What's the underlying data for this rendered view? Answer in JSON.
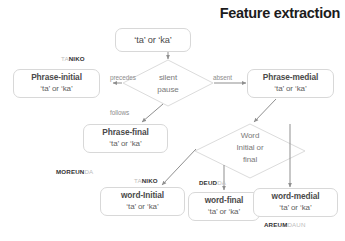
{
  "title": "Feature extraction",
  "nodes": {
    "root": {
      "line1": "‘ta’ or ‘ka’"
    },
    "phrase_initial": {
      "line1": "Phrase-initial",
      "line2": "‘ta’ or ‘ka’"
    },
    "phrase_medial": {
      "line1": "Phrase-medial",
      "line2": "‘ta’ or ‘ka’"
    },
    "phrase_final": {
      "line1": "Phrase-final",
      "line2": "‘ta’ or ‘ka’"
    },
    "word_initial": {
      "line1": "word-Initial",
      "line2": "‘ta’ or ‘ka’"
    },
    "word_final": {
      "line1": "word-final",
      "line2": "‘ta’ or ‘ka’"
    },
    "word_medial": {
      "line1": "word-medial",
      "line2": "‘ta’ or ‘ka’"
    }
  },
  "decisions": {
    "silent_pause": {
      "line1": "silent",
      "line2": "pause"
    },
    "word_position": {
      "line1": "Word",
      "line2": "Initial or",
      "line3": "final"
    }
  },
  "edge_labels": {
    "precedes": "precedes",
    "absent": "absent",
    "follows": "follows"
  },
  "tags": {
    "taniko_top": {
      "light": "TA",
      "bold": "NIKO"
    },
    "moreunda": {
      "bold": "MOREUN",
      "light": "DA"
    },
    "taniko_bottom": {
      "light": "TA",
      "bold": "NIKO"
    },
    "deudda": {
      "bold": "DEUD",
      "light": "DA"
    },
    "areumdaun": {
      "bold": "AREUM",
      "light": "DAUN"
    }
  },
  "colors": {
    "node_border": "#d8d8d8",
    "text_dark": "#4a4a4a",
    "text_muted": "#8c8c8c",
    "tag_bold": "#333333",
    "tag_light": "#bdbdbd",
    "connector": "#9a9a9a"
  }
}
